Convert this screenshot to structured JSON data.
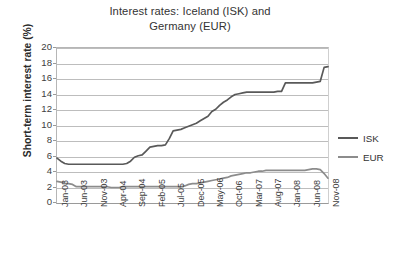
{
  "chart_data": {
    "type": "line",
    "title": "Interest rates: Iceland (ISK) and Germany (EUR)",
    "title_line1": "Interest rates: Iceland (ISK) and",
    "title_line2": "Germany (EUR)",
    "xlabel": "",
    "ylabel": "Short-term interest rate (%)",
    "ylim": [
      0,
      20
    ],
    "yticks": [
      0,
      2,
      4,
      6,
      8,
      10,
      12,
      14,
      16,
      18,
      20
    ],
    "ytick_labels": [
      "0",
      "2",
      "4",
      "6",
      "8",
      "10",
      "12",
      "14",
      "16",
      "18",
      "20"
    ],
    "grid": true,
    "legend_position": "right",
    "xtick_labels": [
      "Jan-03",
      "Jun-03",
      "Nov-03",
      "Apr-04",
      "Sep-04",
      "Feb-05",
      "Jul-05",
      "Dec-05",
      "May-06",
      "Oct-06",
      "Mar-07",
      "Aug-07",
      "Jan-08",
      "Jun-08",
      "Nov-08"
    ],
    "xtick_indices": [
      0,
      5,
      10,
      15,
      20,
      25,
      30,
      35,
      40,
      45,
      50,
      55,
      60,
      65,
      70
    ],
    "x": [
      "Jan-03",
      "Feb-03",
      "Mar-03",
      "Apr-03",
      "May-03",
      "Jun-03",
      "Jul-03",
      "Aug-03",
      "Sep-03",
      "Oct-03",
      "Nov-03",
      "Dec-03",
      "Jan-04",
      "Feb-04",
      "Mar-04",
      "Apr-04",
      "May-04",
      "Jun-04",
      "Jul-04",
      "Aug-04",
      "Sep-04",
      "Oct-04",
      "Nov-04",
      "Dec-04",
      "Jan-05",
      "Feb-05",
      "Mar-05",
      "Apr-05",
      "May-05",
      "Jun-05",
      "Jul-05",
      "Aug-05",
      "Sep-05",
      "Oct-05",
      "Nov-05",
      "Dec-05",
      "Jan-06",
      "Feb-06",
      "Mar-06",
      "Apr-06",
      "May-06",
      "Jun-06",
      "Jul-06",
      "Aug-06",
      "Sep-06",
      "Oct-06",
      "Nov-06",
      "Dec-06",
      "Jan-07",
      "Feb-07",
      "Mar-07",
      "Apr-07",
      "May-07",
      "Jun-07",
      "Jul-07",
      "Aug-07",
      "Sep-07",
      "Oct-07",
      "Nov-07",
      "Dec-07",
      "Jan-08",
      "Feb-08",
      "Mar-08",
      "Apr-08",
      "May-08",
      "Jun-08",
      "Jul-08",
      "Aug-08",
      "Sep-08",
      "Oct-08",
      "Nov-08"
    ],
    "series": [
      {
        "name": "ISK",
        "color": "#595959",
        "values": [
          5.8,
          5.4,
          5.1,
          5.0,
          5.0,
          5.0,
          5.0,
          5.0,
          5.0,
          5.0,
          5.0,
          5.0,
          5.0,
          5.0,
          5.0,
          5.0,
          5.0,
          5.0,
          5.1,
          5.4,
          5.9,
          6.1,
          6.2,
          6.7,
          7.2,
          7.3,
          7.4,
          7.4,
          7.5,
          8.3,
          9.3,
          9.4,
          9.5,
          9.7,
          9.9,
          10.1,
          10.3,
          10.6,
          10.9,
          11.2,
          11.8,
          12.1,
          12.6,
          13.0,
          13.3,
          13.7,
          14.0,
          14.1,
          14.2,
          14.3,
          14.3,
          14.3,
          14.3,
          14.3,
          14.3,
          14.3,
          14.3,
          14.4,
          14.4,
          15.5,
          15.5,
          15.5,
          15.5,
          15.5,
          15.5,
          15.5,
          15.5,
          15.6,
          15.7,
          17.5,
          17.6
        ]
      },
      {
        "name": "EUR",
        "color": "#8c8c8c",
        "values": [
          2.8,
          2.7,
          2.5,
          2.5,
          2.4,
          2.1,
          2.1,
          2.1,
          2.1,
          2.1,
          2.1,
          2.1,
          2.1,
          2.1,
          2.0,
          2.0,
          2.0,
          2.1,
          2.1,
          2.1,
          2.1,
          2.1,
          2.1,
          2.1,
          2.1,
          2.1,
          2.1,
          2.1,
          2.1,
          2.1,
          2.1,
          2.1,
          2.1,
          2.2,
          2.4,
          2.5,
          2.5,
          2.6,
          2.7,
          2.8,
          2.9,
          3.0,
          3.1,
          3.2,
          3.3,
          3.5,
          3.6,
          3.7,
          3.8,
          3.9,
          3.9,
          4.0,
          4.1,
          4.1,
          4.2,
          4.2,
          4.2,
          4.2,
          4.2,
          4.2,
          4.2,
          4.2,
          4.2,
          4.2,
          4.2,
          4.3,
          4.4,
          4.4,
          4.3,
          3.8,
          3.2
        ]
      }
    ]
  },
  "legend": {
    "items": [
      {
        "label": "ISK"
      },
      {
        "label": "EUR"
      }
    ]
  }
}
